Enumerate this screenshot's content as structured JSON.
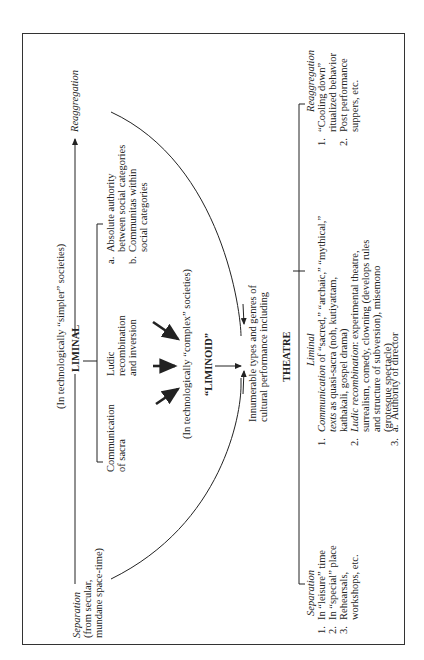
{
  "diagram": {
    "top_label": "(In technologically “simpler” societies)",
    "separation": {
      "title": "Separation",
      "lines": [
        "(from secular,",
        "mundane space-time)"
      ]
    },
    "reaggregation": {
      "title": "Reaggregation"
    },
    "liminal": {
      "title": "LIMINAL",
      "branches": [
        {
          "lines": [
            "Communication",
            "of sacra"
          ]
        },
        {
          "lines": [
            "Ludic",
            "recombination",
            "and inversion"
          ]
        }
      ],
      "sub_items": [
        {
          "marker": "a.",
          "lines": [
            "Absolute authority",
            "between social categories"
          ]
        },
        {
          "marker": "b.",
          "lines": [
            "Communitas within",
            "social categories"
          ]
        }
      ]
    },
    "liminoid": {
      "title": "“LIMINOID”",
      "context": "(In technologically “complex” societies)"
    },
    "genres": {
      "lines": [
        "Innumerable types and genres of",
        "cultural performance including"
      ]
    },
    "theatre": {
      "title": "THEATRE",
      "separation": {
        "title": "Separation",
        "items": [
          {
            "n": "1.",
            "lines": [
              "In “leisure” time"
            ]
          },
          {
            "n": "2.",
            "lines": [
              "In “special” place"
            ]
          },
          {
            "n": "3.",
            "lines": [
              "Rehearsals,",
              "workshops, etc."
            ]
          }
        ]
      },
      "liminal": {
        "title": "Liminal",
        "item1": {
          "n": "1.",
          "lead": "Communication",
          "rest": " of “sacred,” “archaic,” “mythical,”",
          "line2_italic": "texts",
          "line2_rest": " as quasi-sacra (noh, kutiyattam,",
          "line3": "kathakali, gospel drama)"
        },
        "item2": {
          "n": "2.",
          "lead": "Ludic recombination",
          "rest": ": experimental theatre,",
          "lines": [
            "surrealism, comedy, clowning (develops rules",
            "and structure of subversion), misemono",
            "(grotesque spectacle)"
          ]
        },
        "item3": {
          "n": "3.",
          "subs": [
            {
              "marker": "a.",
              "text": "Authority of director"
            },
            {
              "marker": "b.",
              "text": "“Chorus line” communitas"
            }
          ]
        }
      },
      "reaggregation": {
        "title": "Reaggregation",
        "items": [
          {
            "n": "1.",
            "lines": [
              "“Cooling down”",
              "ritualized behavior"
            ]
          },
          {
            "n": "2.",
            "lines": [
              "Post performance",
              "suppers, etc."
            ]
          }
        ]
      }
    }
  }
}
